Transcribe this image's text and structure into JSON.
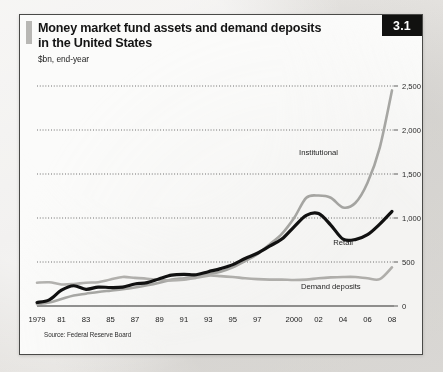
{
  "card": {
    "badge": "3.1",
    "title_line1": "Money market fund assets and demand deposits",
    "title_line2": "in the United States",
    "subtitle": "$bn, end-year",
    "source": "Source: Federal Reserve Board"
  },
  "chart_data": {
    "type": "line",
    "title": "Money market fund assets and demand deposits in the United States",
    "subtitle": "$bn, end-year",
    "xlabel": "",
    "ylabel": "$bn",
    "ylim": [
      0,
      2500
    ],
    "yticks": [
      0,
      500,
      1000,
      1500,
      2000,
      2500
    ],
    "ytick_labels": [
      "0",
      "500",
      "1,000",
      "1,500",
      "2,000",
      "2,500"
    ],
    "grid": "horizontal-dotted",
    "legend": "inline-annotations",
    "x": [
      1979,
      1980,
      1981,
      1982,
      1983,
      1984,
      1985,
      1986,
      1987,
      1988,
      1989,
      1990,
      1991,
      1992,
      1993,
      1994,
      1995,
      1996,
      1997,
      1998,
      1999,
      2000,
      2001,
      2002,
      2003,
      2004,
      2005,
      2006,
      2007,
      2008
    ],
    "xticks": [
      1979,
      1981,
      1983,
      1985,
      1987,
      1989,
      1991,
      1993,
      1995,
      1997,
      2000,
      2002,
      2004,
      2006,
      2008
    ],
    "xtick_labels": [
      "1979",
      "81",
      "83",
      "85",
      "87",
      "89",
      "91",
      "93",
      "95",
      "97",
      "2000",
      "02",
      "04",
      "06",
      "08"
    ],
    "series": [
      {
        "name": "Institutional",
        "color": "#a9a9a6",
        "width": 2.6,
        "values": [
          20,
          40,
          80,
          120,
          140,
          160,
          175,
          190,
          210,
          235,
          265,
          300,
          315,
          330,
          360,
          390,
          440,
          510,
          590,
          700,
          820,
          1000,
          1230,
          1255,
          1230,
          1120,
          1170,
          1400,
          1800,
          2450
        ],
        "label_x": 2002,
        "label_y": 1720
      },
      {
        "name": "Retail",
        "color": "#111111",
        "width": 3.2,
        "values": [
          40,
          70,
          180,
          230,
          190,
          215,
          210,
          215,
          250,
          265,
          310,
          350,
          360,
          355,
          390,
          425,
          470,
          540,
          600,
          680,
          760,
          900,
          1030,
          1050,
          920,
          760,
          755,
          810,
          930,
          1075
        ],
        "label_x": 2004,
        "label_y": 690
      },
      {
        "name": "Demand deposits",
        "color": "#b4b3b0",
        "width": 2.6,
        "values": [
          265,
          270,
          245,
          250,
          265,
          270,
          300,
          330,
          320,
          310,
          295,
          290,
          300,
          320,
          345,
          340,
          330,
          315,
          305,
          300,
          300,
          295,
          300,
          315,
          325,
          330,
          330,
          315,
          305,
          440
        ],
        "label_x": 2003,
        "label_y": 190
      }
    ]
  }
}
